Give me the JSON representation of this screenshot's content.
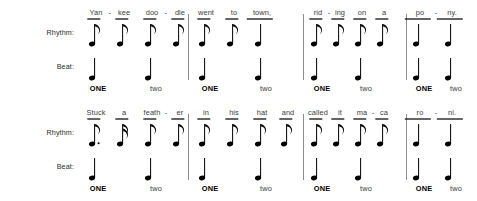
{
  "page": {
    "background_color": "#ffffff",
    "ink_color": "#000000",
    "barline_color": "#8c8c8c"
  },
  "labels": {
    "rhythm": "Rhythm:",
    "beat": "Beat:"
  },
  "beat_words": {
    "strong": "ONE",
    "weak": "two"
  },
  "systems": [
    {
      "index": 0,
      "lyrics_line": "Yan - kee doo - dle went to town, rid - ing on a po - ny.",
      "measures": [
        {
          "index": 0,
          "syllables": [
            "Yan",
            "kee",
            "doo",
            "dle"
          ],
          "hyphens": [
            true,
            false,
            true,
            false
          ],
          "rhythm_notes": [
            "eighth",
            "eighth",
            "eighth",
            "eighth"
          ],
          "beat_notes": [
            "quarter",
            "quarter"
          ],
          "beat_labels": [
            "ONE",
            "two"
          ]
        },
        {
          "index": 1,
          "syllables": [
            "went",
            "to",
            "town,"
          ],
          "hyphens": [
            false,
            false,
            false
          ],
          "rhythm_notes": [
            "eighth",
            "eighth",
            "quarter"
          ],
          "beat_notes": [
            "quarter",
            "quarter"
          ],
          "beat_labels": [
            "ONE",
            "two"
          ]
        },
        {
          "index": 2,
          "syllables": [
            "rid",
            "ing",
            "on",
            "a"
          ],
          "hyphens": [
            true,
            false,
            false,
            false
          ],
          "rhythm_notes": [
            "eighth",
            "eighth",
            "eighth",
            "eighth"
          ],
          "beat_notes": [
            "quarter",
            "quarter"
          ],
          "beat_labels": [
            "ONE",
            "two"
          ]
        },
        {
          "index": 3,
          "syllables": [
            "po",
            "ny."
          ],
          "hyphens": [
            true,
            false
          ],
          "rhythm_notes": [
            "quarter",
            "quarter"
          ],
          "beat_notes": [
            "quarter",
            "quarter"
          ],
          "beat_labels": [
            "ONE",
            "two"
          ]
        }
      ]
    },
    {
      "index": 1,
      "lyrics_line": "Stuck a feath - er in his hat and called it ma - ca - ro - ni.",
      "measures": [
        {
          "index": 0,
          "syllables": [
            "Stuck",
            "a",
            "feath",
            "er"
          ],
          "hyphens": [
            false,
            false,
            true,
            false
          ],
          "rhythm_notes": [
            "dotted-eighth",
            "sixteenth",
            "eighth",
            "eighth"
          ],
          "beat_notes": [
            "quarter",
            "quarter"
          ],
          "beat_labels": [
            "ONE",
            "two"
          ]
        },
        {
          "index": 1,
          "syllables": [
            "in",
            "his",
            "hat",
            "and"
          ],
          "hyphens": [
            false,
            false,
            false,
            false
          ],
          "rhythm_notes": [
            "eighth",
            "eighth",
            "eighth",
            "eighth"
          ],
          "beat_notes": [
            "quarter",
            "quarter"
          ],
          "beat_labels": [
            "ONE",
            "two"
          ]
        },
        {
          "index": 2,
          "syllables": [
            "called",
            "it",
            "ma",
            "ca"
          ],
          "hyphens": [
            false,
            false,
            true,
            false
          ],
          "rhythm_notes": [
            "eighth",
            "eighth",
            "eighth",
            "eighth"
          ],
          "beat_notes": [
            "quarter",
            "quarter"
          ],
          "beat_labels": [
            "ONE",
            "two"
          ]
        },
        {
          "index": 3,
          "syllables": [
            "ro",
            "ni."
          ],
          "hyphens": [
            true,
            false
          ],
          "rhythm_notes": [
            "quarter",
            "quarter"
          ],
          "beat_notes": [
            "quarter",
            "quarter"
          ],
          "beat_labels": [
            "ONE",
            "two"
          ]
        }
      ]
    }
  ],
  "layout": {
    "system_tops": [
      0,
      100
    ],
    "barline_x": [
      188,
      303,
      406
    ],
    "measure_note_x": [
      [
        96,
        124,
        152,
        180
      ],
      [
        206,
        234,
        262
      ],
      [
        318,
        340,
        362,
        384
      ],
      [
        420,
        452
      ]
    ],
    "measure_note_x_row2": [
      [
        96,
        124,
        152,
        180
      ],
      [
        206,
        234,
        262,
        288
      ],
      [
        318,
        340,
        362,
        384
      ],
      [
        420,
        452
      ]
    ],
    "beat_note_x": [
      [
        96,
        152
      ],
      [
        206,
        262
      ],
      [
        318,
        362
      ],
      [
        420,
        452
      ]
    ],
    "beat_label_x": [
      [
        98,
        156
      ],
      [
        210,
        266
      ],
      [
        322,
        366
      ],
      [
        424,
        456
      ]
    ]
  }
}
